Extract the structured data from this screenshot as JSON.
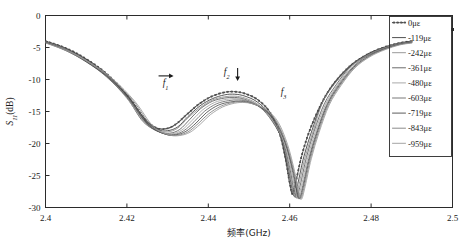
{
  "chart_data": {
    "type": "line",
    "title": "",
    "xlabel": "频率(GHz)",
    "ylabel": "S11(dB)",
    "xlim": [
      2.4,
      2.5
    ],
    "ylim": [
      -30,
      0
    ],
    "xticks": [
      "2.4",
      "2.42",
      "2.44",
      "2.46",
      "2.48",
      "2.5"
    ],
    "xtick_values": [
      2.4,
      2.42,
      2.44,
      2.46,
      2.48,
      2.5
    ],
    "yticks": [
      "0",
      "-5",
      "-10",
      "-15",
      "-20",
      "-25",
      "-30"
    ],
    "ytick_values": [
      0,
      -5,
      -10,
      -15,
      -20,
      -25,
      -30
    ],
    "grid": false,
    "legend_position": "right-inside",
    "annotations": [
      {
        "name": "f1",
        "label": "f",
        "sub": "1",
        "arrow": "right",
        "x": 2.4295,
        "y": -11.0
      },
      {
        "name": "f2",
        "label": "f",
        "sub": "2",
        "arrow": "down",
        "x": 2.4445,
        "y": -9.3
      },
      {
        "name": "f3",
        "label": "f",
        "sub": "3",
        "arrow": "none",
        "x": 2.4585,
        "y": -12.4
      }
    ],
    "series": [
      {
        "name": "0με",
        "color": "#4f4f4f",
        "style": "dashed-marker",
        "x": [
          2.4,
          2.405,
          2.41,
          2.415,
          2.42,
          2.424,
          2.427,
          2.4295,
          2.432,
          2.435,
          2.438,
          2.441,
          2.444,
          2.4465,
          2.449,
          2.452,
          2.455,
          2.4575,
          2.459,
          2.46,
          2.4607,
          2.4615,
          2.463,
          2.465,
          2.468,
          2.471,
          2.475,
          2.479,
          2.483,
          2.487,
          2.49
        ],
        "y": [
          -4.0,
          -5.1,
          -6.8,
          -9.1,
          -12.4,
          -15.9,
          -17.5,
          -17.7,
          -17.0,
          -15.3,
          -13.7,
          -12.6,
          -12.0,
          -11.9,
          -12.2,
          -13.1,
          -15.0,
          -18.4,
          -22.5,
          -26.2,
          -27.9,
          -26.0,
          -21.8,
          -17.8,
          -13.5,
          -10.5,
          -7.8,
          -6.1,
          -5.0,
          -4.3,
          -4.0
        ]
      },
      {
        "name": "-119με",
        "color": "#3a3a3a",
        "style": "solid",
        "x": [
          2.4,
          2.405,
          2.41,
          2.415,
          2.42,
          2.424,
          2.4275,
          2.43,
          2.4325,
          2.435,
          2.438,
          2.441,
          2.444,
          2.4465,
          2.449,
          2.452,
          2.455,
          2.4578,
          2.4595,
          2.4605,
          2.4612,
          2.462,
          2.4635,
          2.4655,
          2.468,
          2.471,
          2.475,
          2.479,
          2.483,
          2.487,
          2.49
        ],
        "y": [
          -4.05,
          -5.2,
          -6.9,
          -9.25,
          -12.6,
          -16.2,
          -17.8,
          -18.0,
          -17.4,
          -15.8,
          -14.1,
          -13.0,
          -12.4,
          -12.3,
          -12.6,
          -13.5,
          -15.4,
          -18.9,
          -23.3,
          -26.8,
          -28.3,
          -26.3,
          -22.0,
          -17.9,
          -13.6,
          -10.6,
          -7.85,
          -6.15,
          -5.05,
          -4.35,
          -4.05
        ]
      },
      {
        "name": "-242με",
        "color": "#8d8d8d",
        "style": "solid",
        "x": [
          2.4,
          2.405,
          2.41,
          2.415,
          2.42,
          2.424,
          2.4275,
          2.43,
          2.4325,
          2.435,
          2.438,
          2.441,
          2.444,
          2.4465,
          2.449,
          2.452,
          2.455,
          2.458,
          2.4597,
          2.4607,
          2.4614,
          2.4623,
          2.4638,
          2.4658,
          2.468,
          2.471,
          2.475,
          2.479,
          2.483,
          2.487,
          2.49
        ],
        "y": [
          -4.1,
          -5.25,
          -7.0,
          -9.35,
          -12.7,
          -16.4,
          -18.0,
          -18.2,
          -17.6,
          -16.0,
          -14.4,
          -13.2,
          -12.7,
          -12.6,
          -12.9,
          -13.8,
          -15.7,
          -19.2,
          -23.6,
          -27.0,
          -28.4,
          -26.4,
          -22.1,
          -18.0,
          -13.7,
          -10.7,
          -7.9,
          -6.2,
          -5.1,
          -4.4,
          -4.1
        ]
      },
      {
        "name": "-361με",
        "color": "#5a5a5a",
        "style": "solid",
        "x": [
          2.4,
          2.405,
          2.41,
          2.415,
          2.42,
          2.424,
          2.428,
          2.4305,
          2.433,
          2.4355,
          2.438,
          2.441,
          2.444,
          2.4465,
          2.449,
          2.452,
          2.455,
          2.4582,
          2.46,
          2.461,
          2.4617,
          2.4626,
          2.4641,
          2.466,
          2.4685,
          2.4715,
          2.475,
          2.479,
          2.483,
          2.487,
          2.49
        ],
        "y": [
          -4.1,
          -5.3,
          -7.05,
          -9.45,
          -12.85,
          -16.6,
          -18.2,
          -18.4,
          -17.8,
          -16.2,
          -14.6,
          -13.4,
          -12.9,
          -12.8,
          -13.1,
          -14.0,
          -15.9,
          -19.4,
          -23.8,
          -27.2,
          -28.5,
          -26.5,
          -22.2,
          -18.1,
          -13.8,
          -10.75,
          -7.95,
          -6.25,
          -5.15,
          -4.4,
          -4.1
        ]
      },
      {
        "name": "-480με",
        "color": "#a0a0a0",
        "style": "solid",
        "x": [
          2.4,
          2.405,
          2.41,
          2.415,
          2.42,
          2.4245,
          2.4285,
          2.431,
          2.4335,
          2.436,
          2.4385,
          2.4415,
          2.4445,
          2.447,
          2.4495,
          2.4525,
          2.4555,
          2.4585,
          2.4603,
          2.4613,
          2.462,
          2.4629,
          2.4644,
          2.4663,
          2.4688,
          2.4718,
          2.4752,
          2.479,
          2.483,
          2.487,
          2.49
        ],
        "y": [
          -4.15,
          -5.35,
          -7.1,
          -9.5,
          -12.95,
          -16.8,
          -18.3,
          -18.5,
          -17.9,
          -16.4,
          -14.8,
          -13.6,
          -13.1,
          -13.0,
          -13.3,
          -14.2,
          -16.1,
          -19.6,
          -24.0,
          -27.3,
          -28.55,
          -26.55,
          -22.25,
          -18.15,
          -13.85,
          -10.8,
          -8.0,
          -6.3,
          -5.2,
          -4.45,
          -4.15
        ]
      },
      {
        "name": "-603με",
        "color": "#6a6a6a",
        "style": "solid",
        "x": [
          2.4,
          2.405,
          2.41,
          2.415,
          2.4205,
          2.425,
          2.429,
          2.4315,
          2.434,
          2.4365,
          2.439,
          2.442,
          2.445,
          2.4475,
          2.45,
          2.453,
          2.456,
          2.4588,
          2.4606,
          2.4616,
          2.4623,
          2.4632,
          2.4647,
          2.4666,
          2.4691,
          2.472,
          2.4755,
          2.479,
          2.483,
          2.487,
          2.49
        ],
        "y": [
          -4.2,
          -5.4,
          -7.2,
          -9.6,
          -13.1,
          -17.0,
          -18.45,
          -18.6,
          -18.0,
          -16.6,
          -15.0,
          -13.8,
          -13.3,
          -13.2,
          -13.5,
          -14.4,
          -16.3,
          -19.8,
          -24.1,
          -27.4,
          -28.6,
          -26.6,
          -22.3,
          -18.2,
          -13.9,
          -10.85,
          -8.05,
          -6.35,
          -5.25,
          -4.5,
          -4.2
        ]
      },
      {
        "name": "-719με",
        "color": "#4a4a4a",
        "style": "solid",
        "x": [
          2.4,
          2.405,
          2.41,
          2.4155,
          2.421,
          2.4255,
          2.4295,
          2.432,
          2.4345,
          2.437,
          2.4395,
          2.4425,
          2.4455,
          2.448,
          2.4505,
          2.4535,
          2.4565,
          2.459,
          2.4608,
          2.4618,
          2.4625,
          2.4634,
          2.4649,
          2.4668,
          2.4693,
          2.4722,
          2.4757,
          2.4793,
          2.483,
          2.487,
          2.49
        ],
        "y": [
          -4.2,
          -5.45,
          -7.25,
          -9.7,
          -13.2,
          -17.15,
          -18.55,
          -18.65,
          -18.1,
          -16.8,
          -15.2,
          -14.0,
          -13.5,
          -13.4,
          -13.7,
          -14.6,
          -16.5,
          -20.0,
          -24.2,
          -27.45,
          -28.6,
          -26.6,
          -22.3,
          -18.2,
          -13.9,
          -10.9,
          -8.1,
          -6.4,
          -5.3,
          -4.5,
          -4.2
        ]
      },
      {
        "name": "-843με",
        "color": "#7d7d7d",
        "style": "solid",
        "x": [
          2.4,
          2.405,
          2.4105,
          2.416,
          2.4215,
          2.426,
          2.43,
          2.4325,
          2.435,
          2.4375,
          2.44,
          2.443,
          2.446,
          2.4485,
          2.451,
          2.454,
          2.4568,
          2.4592,
          2.461,
          2.462,
          2.4627,
          2.4636,
          2.4651,
          2.467,
          2.4695,
          2.4724,
          2.4759,
          2.4795,
          2.4832,
          2.487,
          2.49
        ],
        "y": [
          -4.25,
          -5.5,
          -7.3,
          -9.8,
          -13.3,
          -17.25,
          -18.6,
          -18.7,
          -18.2,
          -16.9,
          -15.4,
          -14.2,
          -13.6,
          -13.5,
          -13.8,
          -14.7,
          -16.6,
          -20.1,
          -24.3,
          -27.5,
          -28.65,
          -26.65,
          -22.35,
          -18.25,
          -13.95,
          -10.9,
          -8.15,
          -6.4,
          -5.3,
          -4.55,
          -4.25
        ]
      },
      {
        "name": "-959με",
        "color": "#9a9a9a",
        "style": "solid",
        "x": [
          2.4,
          2.4055,
          2.411,
          2.4165,
          2.422,
          2.4265,
          2.4305,
          2.433,
          2.4355,
          2.438,
          2.4405,
          2.4435,
          2.4465,
          2.449,
          2.4515,
          2.4545,
          2.4572,
          2.4595,
          2.4612,
          2.4622,
          2.4629,
          2.4638,
          2.4653,
          2.4672,
          2.4697,
          2.4726,
          2.476,
          2.4797,
          2.4834,
          2.487,
          2.49
        ],
        "y": [
          -4.3,
          -5.55,
          -7.4,
          -9.9,
          -13.45,
          -17.35,
          -18.65,
          -18.75,
          -18.25,
          -17.0,
          -15.5,
          -14.3,
          -13.7,
          -13.6,
          -13.9,
          -14.8,
          -16.7,
          -20.2,
          -24.35,
          -27.55,
          -28.7,
          -26.7,
          -22.4,
          -18.3,
          -14.0,
          -10.95,
          -8.2,
          -6.45,
          -5.35,
          -4.6,
          -4.3
        ]
      }
    ]
  }
}
